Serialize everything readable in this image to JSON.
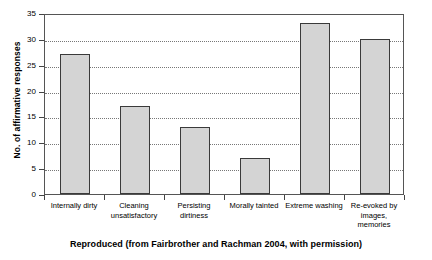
{
  "chart_data": {
    "type": "bar",
    "title": "",
    "subtitle": "",
    "xlabel": "",
    "ylabel": "No. of affirmative responses",
    "categories": [
      "Internally dirty",
      "Cleaning unsatisfactory",
      "Persisting dirtiness",
      "Morally tainted",
      "Extreme washing",
      "Re-evoked by images, memories"
    ],
    "category_lines": [
      [
        "Internally dirty"
      ],
      [
        "Cleaning",
        "unsatisfactory"
      ],
      [
        "Persisting",
        "dirtiness"
      ],
      [
        "Morally tainted"
      ],
      [
        "Extreme washing"
      ],
      [
        "Re-evoked by",
        "images,",
        "memories"
      ]
    ],
    "values": [
      27,
      17,
      13,
      7,
      33,
      30
    ],
    "ylim": [
      0,
      35
    ],
    "yticks": [
      0,
      5,
      10,
      15,
      20,
      25,
      30,
      35
    ],
    "ytick_labels": [
      "0",
      "5",
      "10",
      "15",
      "20",
      "25",
      "30",
      "35"
    ],
    "grid": true,
    "grid_axis": "y",
    "legend": "none",
    "bar_fill_color": "#d4d4d4",
    "bar_border_color": "#3a3a3a",
    "frame_color": "#555555",
    "gridline_color": "#777777"
  },
  "caption": {
    "text": "Reproduced (from Fairbrother and Rachman 2004, with permission)"
  }
}
